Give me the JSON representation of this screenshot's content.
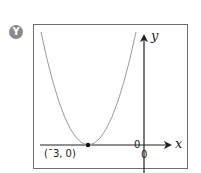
{
  "badge": {
    "label": "Y",
    "color": "#8a8a8a"
  },
  "diagram": {
    "type": "parabola-graph",
    "axes": {
      "x_label": "x",
      "y_label": "y",
      "origin_label_left": "0",
      "origin_label_below": "0"
    },
    "curve": {
      "shape": "parabola opening upward",
      "vertex_label": "(¯3, 0)",
      "vertex": [
        -3,
        0
      ],
      "color": "#9a9a9a"
    },
    "frame_color": "#6e6e6e",
    "axis_color": "#222222"
  }
}
